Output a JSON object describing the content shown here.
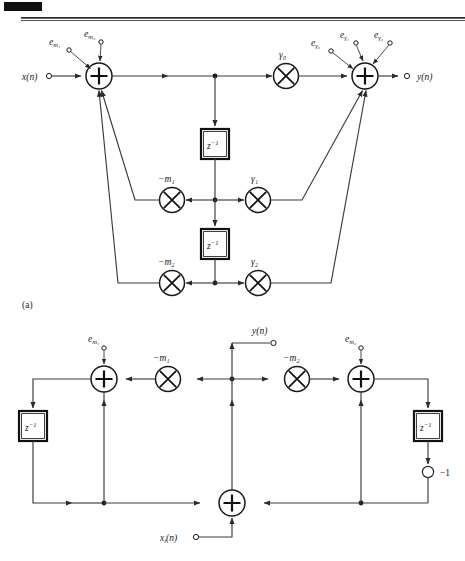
{
  "page": {
    "header_rule": true,
    "corner_tab": true
  },
  "figure_a": {
    "caption": "(a)",
    "input_label": "x(n)",
    "output_label": "y(n)",
    "noise_inputs": [
      {
        "base": "e",
        "sub": "m₁",
        "name": "e-m1"
      },
      {
        "base": "e",
        "sub": "m₂",
        "name": "e-m2"
      },
      {
        "base": "e",
        "sub": "γ₀",
        "name": "e-gamma0"
      },
      {
        "base": "e",
        "sub": "γ₁",
        "name": "e-gamma1"
      },
      {
        "base": "e",
        "sub": "γ₂",
        "name": "e-gamma2"
      }
    ],
    "multipliers": [
      {
        "label": "γ₀",
        "name": "gamma0"
      },
      {
        "label": "−m₁",
        "name": "neg-m1"
      },
      {
        "label": "γ₁",
        "name": "gamma1"
      },
      {
        "label": "−m₂",
        "name": "neg-m2"
      },
      {
        "label": "γ₂",
        "name": "gamma2"
      }
    ],
    "delays": [
      {
        "label": "z",
        "exp": "−1"
      },
      {
        "label": "z",
        "exp": "−1"
      }
    ],
    "adders": [
      "input-adder",
      "output-adder"
    ]
  },
  "figure_b": {
    "input_label": "x",
    "input_sub": "i",
    "input_suffix": "(n)",
    "output_label": "y(n)",
    "noise_inputs": [
      {
        "base": "e",
        "sub": "m₁",
        "name": "e-m1"
      },
      {
        "base": "e",
        "sub": "m₂",
        "name": "e-m2"
      }
    ],
    "multipliers": [
      {
        "label": "−m₁",
        "name": "neg-m1"
      },
      {
        "label": "−m₂",
        "name": "neg-m2"
      }
    ],
    "delays": [
      {
        "label": "z",
        "exp": "−1"
      },
      {
        "label": "z",
        "exp": "−1"
      }
    ],
    "gain_label": "−1",
    "adders": [
      "left-adder",
      "right-adder",
      "bottom-adder"
    ]
  }
}
